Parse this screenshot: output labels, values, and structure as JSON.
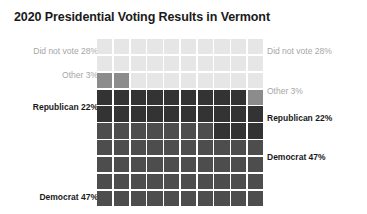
{
  "title": "2020 Presidential Voting Results in Vermont",
  "chart_data": {
    "type": "waffle",
    "title": "2020 Presidential Voting Results in Vermont",
    "xlabel": "",
    "ylabel": "",
    "grid_rows": 10,
    "grid_cols": 10,
    "total_cells": 100,
    "fill_order": "bottom-left to top-right",
    "legend_position": "both-sides",
    "grid": true,
    "categories": [
      "Democrat",
      "Republican",
      "Other",
      "Did not vote"
    ],
    "values": [
      47,
      22,
      3,
      28
    ],
    "units": "percent",
    "series": [
      {
        "name": "Democrat",
        "value": 47,
        "label": "Democrat 47%",
        "color": "#4d4d4d",
        "emphasis": "strong"
      },
      {
        "name": "Republican",
        "value": 22,
        "label": "Republican 22%",
        "color": "#333333",
        "emphasis": "strong"
      },
      {
        "name": "Other",
        "value": 3,
        "label": "Other 3%",
        "color": "#8c8c8c",
        "emphasis": "muted"
      },
      {
        "name": "Did not vote",
        "value": 28,
        "label": "Did not vote 28%",
        "color": "#e6e6e6",
        "emphasis": "muted"
      }
    ]
  },
  "labels": {
    "did_not_vote": "Did not vote 28%",
    "other": "Other 3%",
    "republican": "Republican 22%",
    "democrat": "Democrat 47%"
  },
  "colors": {
    "did_not_vote": "#e6e6e6",
    "other": "#8c8c8c",
    "republican": "#333333",
    "democrat": "#4d4d4d",
    "background": "#ffffff",
    "title_text": "#1a1a1a",
    "muted_text": "#a6a6a6"
  }
}
